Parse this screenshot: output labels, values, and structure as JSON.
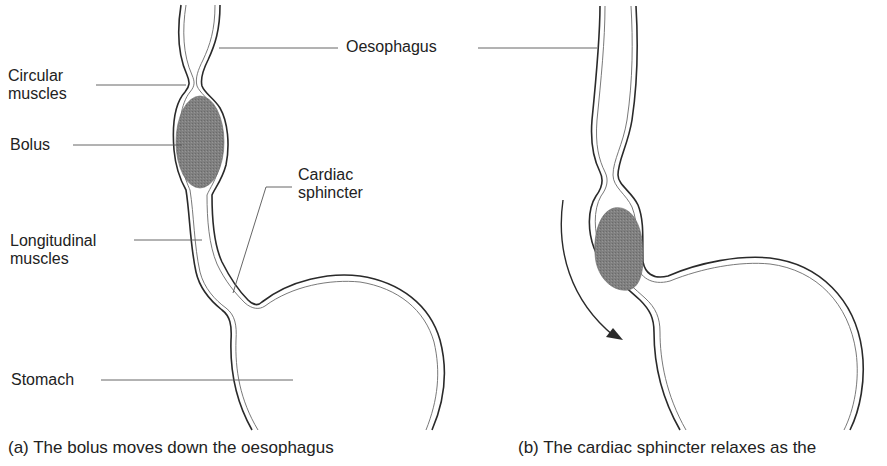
{
  "figure": {
    "panel_a": {
      "caption": "(a) The bolus moves down the oesophagus",
      "labels": {
        "circular_muscles_line1": "Circular",
        "circular_muscles_line2": "muscles",
        "bolus": "Bolus",
        "longitudinal_muscles_line1": "Longitudinal",
        "longitudinal_muscles_line2": "muscles",
        "stomach": "Stomach",
        "cardiac_sphincter_line1": "Cardiac",
        "cardiac_sphincter_line2": "sphincter"
      }
    },
    "shared": {
      "oesophagus": "Oesophagus"
    },
    "panel_b": {
      "caption": "(b) The cardiac sphincter relaxes as the"
    },
    "colors": {
      "outline": "#2a2a2a",
      "inner_line": "#6a6a6a",
      "bolus_fill": "#7d7d7d",
      "leader_line": "#555555",
      "text": "#222222",
      "background": "#ffffff"
    },
    "icons": {
      "arrow": "curved-down-arrow"
    }
  }
}
